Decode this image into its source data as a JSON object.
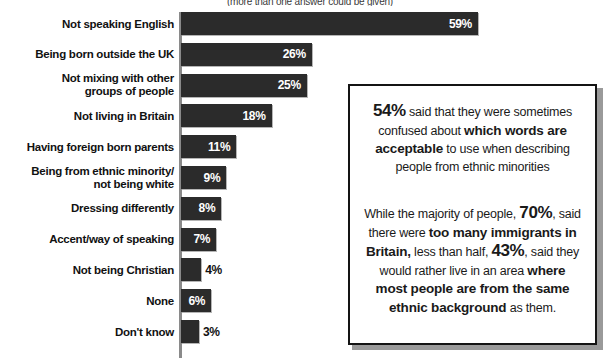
{
  "caption": "(more than one answer could be given)",
  "chart_data": {
    "type": "bar",
    "orientation": "horizontal",
    "title": "",
    "subtitle": "(more than one answer could be given)",
    "xlabel": "",
    "ylabel": "",
    "xlim": [
      0,
      59
    ],
    "grid": false,
    "legend": null,
    "bar_color": "#2b2b2b",
    "value_suffix": "%",
    "categories": [
      "Not speaking English",
      "Being born outside the UK",
      "Not mixing with other groups of people",
      "Not living in Britain",
      "Having foreign born parents",
      "Being from ethnic minority/ not being white",
      "Dressing differently",
      "Accent/way of speaking",
      "Not being Christian",
      "None",
      "Don't know"
    ],
    "values": [
      59,
      26,
      25,
      18,
      11,
      9,
      8,
      7,
      4,
      6,
      3
    ]
  },
  "bars": [
    {
      "label_lines": [
        "Not speaking English"
      ],
      "value": 59,
      "value_text": "59%",
      "inside": true
    },
    {
      "label_lines": [
        "Being born outside the UK"
      ],
      "value": 26,
      "value_text": "26%",
      "inside": true
    },
    {
      "label_lines": [
        "Not mixing with other",
        "groups of people"
      ],
      "value": 25,
      "value_text": "25%",
      "inside": true
    },
    {
      "label_lines": [
        "Not living in Britain"
      ],
      "value": 18,
      "value_text": "18%",
      "inside": true
    },
    {
      "label_lines": [
        "Having foreign born parents"
      ],
      "value": 11,
      "value_text": "11%",
      "inside": true
    },
    {
      "label_lines": [
        "Being from ethnic minority/",
        "not being white"
      ],
      "value": 9,
      "value_text": "9%",
      "inside": true
    },
    {
      "label_lines": [
        "Dressing differently"
      ],
      "value": 8,
      "value_text": "8%",
      "inside": true
    },
    {
      "label_lines": [
        "Accent/way of speaking"
      ],
      "value": 7,
      "value_text": "7%",
      "inside": true
    },
    {
      "label_lines": [
        "Not being Christian"
      ],
      "value": 4,
      "value_text": "4%",
      "inside": false
    },
    {
      "label_lines": [
        "None"
      ],
      "value": 6,
      "value_text": "6%",
      "inside": true
    },
    {
      "label_lines": [
        "Don't know"
      ],
      "value": 3,
      "value_text": "3%",
      "inside": false
    }
  ],
  "panel": {
    "paragraph1": {
      "stat": "54%",
      "text_a": " said that they were sometimes confused about ",
      "bold_a": "which words are acceptable",
      "text_b": " to use when describing people from ethnic minorities"
    },
    "paragraph2": {
      "text_a": "While the majority of people, ",
      "stat_a": "70%",
      "text_b": ", said there were ",
      "bold_a": "too many immigrants in Britain,",
      "text_c": " less than half, ",
      "stat_b": "43%",
      "text_d": ", said they would rather live in an area ",
      "bold_b": "where most people are from the same ethnic background",
      "text_e": " as them."
    }
  }
}
